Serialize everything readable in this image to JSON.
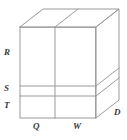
{
  "figure": {
    "type": "geometric-diagram",
    "shape": "rectangular-prism",
    "projection": "oblique",
    "stroke_color": "#9a9a9a",
    "label_color": "#3a3a3a",
    "background_color": "#ffffff",
    "labels": {
      "left_top": "R",
      "left_middle": "S",
      "left_bottom": "T",
      "bottom_left": "Q",
      "bottom_right": "W",
      "depth": "D"
    },
    "geometry": {
      "front_face": {
        "x_left": 20,
        "x_right": 96,
        "y_top": 27,
        "y_bottom": 118,
        "vertical_divider_x": 55,
        "horizontal_divider_1_y": 86,
        "horizontal_divider_2_y": 96
      },
      "depth_offset": {
        "dx": 23,
        "dy": -18
      }
    }
  }
}
